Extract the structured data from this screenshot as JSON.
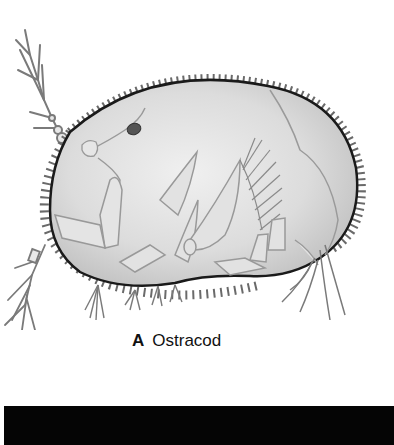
{
  "figure": {
    "caption_letter": "A",
    "caption_text": "Ostracod",
    "colors": {
      "shell_fill": "#d9d9d9",
      "shell_outline": "#1a1a1a",
      "limb_stroke": "#8a8a8a",
      "eye": "#555555",
      "bar": "#050505"
    }
  },
  "footer_bar": {
    "label": ""
  }
}
